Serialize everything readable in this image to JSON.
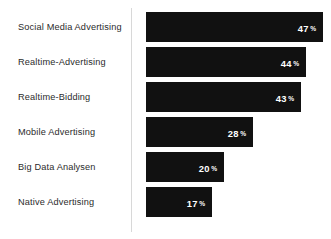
{
  "chart_data": {
    "type": "bar",
    "orientation": "horizontal",
    "title": "",
    "subtitle": "",
    "xlabel": "",
    "ylabel": "",
    "unit": "%",
    "grid": false,
    "legend": null,
    "xlim": [
      0,
      50
    ],
    "axis_line": "vertical-left",
    "bar_color": "#111111",
    "value_label_color": "#ffffff",
    "category_label_color": "#2b2b2b",
    "categories": [
      "Social Media Advertising",
      "Realtime-Advertising",
      "Realtime-Bidding",
      "Mobile Advertising",
      "Big Data Analysen",
      "Native Advertising"
    ],
    "values": [
      47,
      44,
      43,
      28,
      20,
      17
    ],
    "value_labels": [
      "47",
      "44",
      "43",
      "28",
      "20",
      "17"
    ],
    "percent_symbol": "%"
  },
  "rows": [
    {
      "label": "Social Media Advertising",
      "value": 47,
      "value_text": "47",
      "pct": "%",
      "top": 12,
      "bar_width": 177
    },
    {
      "label": "Realtime-Advertising",
      "value": 44,
      "value_text": "44",
      "pct": "%",
      "top": 47,
      "bar_width": 160
    },
    {
      "label": "Realtime-Bidding",
      "value": 43,
      "value_text": "43",
      "pct": "%",
      "top": 82,
      "bar_width": 155
    },
    {
      "label": "Mobile Advertising",
      "value": 28,
      "value_text": "28",
      "pct": "%",
      "top": 117,
      "bar_width": 107
    },
    {
      "label": "Big Data Analysen",
      "value": 20,
      "value_text": "20",
      "pct": "%",
      "top": 152,
      "bar_width": 78
    },
    {
      "label": "Native Advertising",
      "value": 17,
      "value_text": "17",
      "pct": "%",
      "top": 187,
      "bar_width": 66
    }
  ]
}
